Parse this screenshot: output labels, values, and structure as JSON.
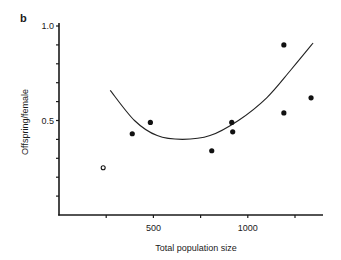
{
  "panel_label": "b",
  "chart_data": {
    "type": "scatter",
    "title": "",
    "panel": "b",
    "xlabel": "Total population size",
    "ylabel": "Offspring/female",
    "xlim": [
      0,
      1390
    ],
    "ylim": [
      0,
      1.0
    ],
    "x_ticks": [
      250,
      500,
      750,
      1000,
      1250
    ],
    "x_tick_labels": [
      {
        "value": 500,
        "label": "500"
      },
      {
        "value": 1000,
        "label": "1000"
      }
    ],
    "y_ticks": [
      0.1,
      0.2,
      0.3,
      0.4,
      0.5,
      0.6,
      0.7,
      0.8,
      0.9,
      1.0
    ],
    "y_tick_labels": [
      {
        "value": 0.5,
        "label": "0.5"
      },
      {
        "value": 1.0,
        "label": "1.0"
      }
    ],
    "grid": false,
    "legend": null,
    "series": [
      {
        "name": "Observed (filled)",
        "marker": "filled-circle",
        "points": [
          {
            "x": 388,
            "y": 0.43
          },
          {
            "x": 484,
            "y": 0.49
          },
          {
            "x": 809,
            "y": 0.34
          },
          {
            "x": 915,
            "y": 0.49
          },
          {
            "x": 920,
            "y": 0.44
          },
          {
            "x": 1191,
            "y": 0.9
          },
          {
            "x": 1191,
            "y": 0.54
          },
          {
            "x": 1335,
            "y": 0.62
          }
        ]
      },
      {
        "name": "Observed (open)",
        "marker": "open-circle",
        "points": [
          {
            "x": 234,
            "y": 0.25
          }
        ]
      },
      {
        "name": "Fitted curve",
        "type": "line",
        "points": [
          {
            "x": 271,
            "y": 0.66
          },
          {
            "x": 400,
            "y": 0.5
          },
          {
            "x": 520,
            "y": 0.42
          },
          {
            "x": 654,
            "y": 0.4
          },
          {
            "x": 800,
            "y": 0.42
          },
          {
            "x": 950,
            "y": 0.5
          },
          {
            "x": 1100,
            "y": 0.62
          },
          {
            "x": 1230,
            "y": 0.77
          },
          {
            "x": 1346,
            "y": 0.91
          }
        ]
      }
    ]
  }
}
